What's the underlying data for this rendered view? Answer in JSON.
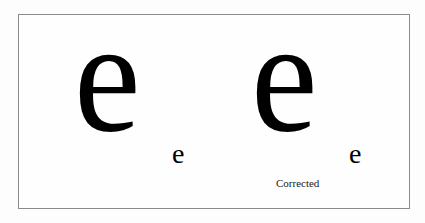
{
  "figure": {
    "left_pair": {
      "large_glyph": "e",
      "small_glyph": "e",
      "caption": ""
    },
    "right_pair": {
      "large_glyph": "e",
      "small_glyph": "e",
      "caption": "Corrected"
    }
  }
}
